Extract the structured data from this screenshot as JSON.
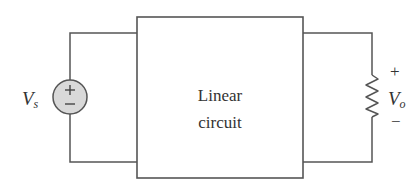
{
  "diagram": {
    "type": "circuit",
    "block": {
      "label_line1": "Linear",
      "label_line2": "circuit"
    },
    "source": {
      "symbol": "V",
      "subscript": "s",
      "plus": "+",
      "minus": "−",
      "kind": "independent voltage source"
    },
    "load": {
      "symbol": "V",
      "subscript": "o",
      "plus": "+",
      "minus": "−",
      "kind": "resistor"
    },
    "colors": {
      "line": "#555555",
      "source_fill": "#d9d9d9",
      "text": "#333333"
    }
  }
}
